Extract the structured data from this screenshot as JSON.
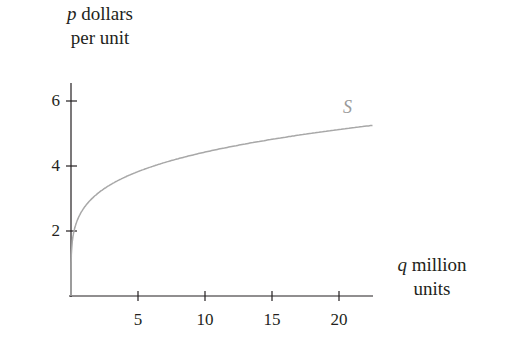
{
  "chart_data": {
    "type": "line",
    "title": "",
    "ylabel": {
      "var": "p",
      "text": "dollars",
      "line2": "per unit"
    },
    "xlabel": {
      "var": "q",
      "text": "million",
      "line2": "units"
    },
    "xlim": [
      0,
      22.5
    ],
    "ylim": [
      0,
      6.5
    ],
    "xticks": [
      5,
      10,
      15,
      20
    ],
    "yticks": [
      2,
      4,
      6
    ],
    "grid": false,
    "legend": "none",
    "series": [
      {
        "name": "S",
        "color": "#a8a8a8",
        "x": [
          0,
          0.1,
          0.5,
          1,
          2,
          3,
          4,
          5,
          7.5,
          10,
          12.5,
          15,
          17.5,
          20,
          22.5
        ],
        "y": [
          0,
          1.68,
          2.35,
          2.73,
          3.16,
          3.45,
          3.66,
          3.83,
          4.17,
          4.43,
          4.64,
          4.81,
          4.97,
          5.11,
          5.24
        ]
      }
    ]
  },
  "labels": {
    "y_var": "p",
    "y_text": " dollars",
    "y_line2": "per unit",
    "x_var": "q",
    "x_text": " million",
    "x_line2": "units",
    "series_label": "S",
    "ytick_2": "2",
    "ytick_4": "4",
    "ytick_6": "6",
    "xtick_5": "5",
    "xtick_10": "10",
    "xtick_15": "15",
    "xtick_20": "20"
  }
}
